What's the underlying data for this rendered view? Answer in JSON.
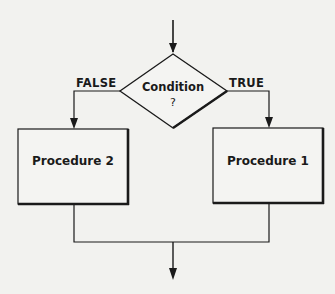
{
  "diagram": {
    "type": "flowchart-if-else",
    "decision": {
      "label": "Condition",
      "symbol": "?"
    },
    "branches": {
      "false": {
        "label": "FALSE",
        "target": "Procedure 2"
      },
      "true": {
        "label": "TRUE",
        "target": "Procedure 1"
      }
    },
    "processes": [
      {
        "id": "left",
        "label": "Procedure 2"
      },
      {
        "id": "right",
        "label": "Procedure 1"
      }
    ],
    "colors": {
      "stroke": "#1a1a1a",
      "background": "#f2f2ef",
      "box_fill": "#f4f4f2"
    }
  }
}
